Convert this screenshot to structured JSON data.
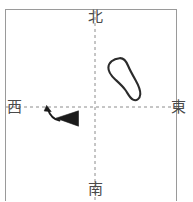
{
  "figure": {
    "kind": "compass-orientation-diagram",
    "frame": {
      "stroke_color": "#9a9a9a",
      "fill_color": "#ffffff",
      "x": 5.5,
      "y": 9.5,
      "width": 171,
      "height": 192
    },
    "axes": {
      "stroke_color": "#8c8c8c",
      "dash": "3 3",
      "vertical_x": 95,
      "horizontal_y": 107
    },
    "directions": {
      "north": "北",
      "south": "南",
      "east": "東",
      "west": "西",
      "label_color": "#4a4a4a"
    },
    "loop": {
      "name": "footprint-outline",
      "stroke_color": "#2b2b2b",
      "stroke_width": 2.1,
      "quadrant": "northeast",
      "bbox": [
        108,
        57,
        32,
        44
      ]
    },
    "marker": {
      "name": "left-pointing-triangle",
      "fill_color": "#1a1a1a",
      "quadrant": "southwest",
      "apex": [
        56,
        118
      ],
      "top_back": [
        78,
        111
      ],
      "bottom_back": [
        78,
        126
      ]
    },
    "curved_arrow": {
      "name": "rotation-arrow",
      "stroke_color": "#1a1a1a",
      "stroke_width": 1.8,
      "from": [
        58,
        120
      ],
      "to": [
        47,
        107
      ],
      "direction": "up-left"
    }
  }
}
